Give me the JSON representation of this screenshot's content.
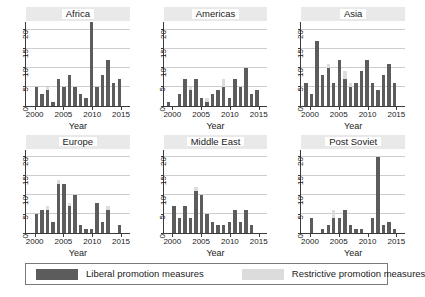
{
  "chart_data": {
    "type": "bar",
    "title": "",
    "subtitle": "",
    "xlabel": "Year",
    "ylabel": "",
    "ylim": [
      0,
      22
    ],
    "xlim": [
      1999,
      2016
    ],
    "grid": true,
    "stacked": true,
    "legend_position": "bottom",
    "yticks": [
      0,
      5,
      10,
      15,
      20
    ],
    "ytick_labels": [
      "0",
      "5",
      "10",
      "15",
      "20"
    ],
    "xticks": [
      2000,
      2005,
      2010,
      2015
    ],
    "xtick_labels": [
      "2000",
      "2005",
      "2010",
      "2015"
    ],
    "x": [
      1999,
      2000,
      2001,
      2002,
      2003,
      2004,
      2005,
      2006,
      2007,
      2008,
      2009,
      2010,
      2011,
      2012,
      2013,
      2014,
      2015,
      2016
    ],
    "series_names": [
      "Liberal promotion measures",
      "Restrictive promotion measures"
    ],
    "colors": {
      "liberal": "#5c5c5c",
      "restrictive": "#dcdcdc",
      "gridline": "#cdcdcd",
      "axis": "#3b3b3b",
      "strip_background": "#e9e9e9",
      "background": "#ffffff"
    },
    "panels": [
      {
        "title": "Africa",
        "series": [
          {
            "name": "Liberal promotion measures",
            "values": [
              0,
              5,
              3,
              4,
              1,
              7,
              5,
              8,
              5,
              3,
              2,
              22,
              5,
              8,
              12,
              6,
              7,
              0
            ]
          },
          {
            "name": "Restrictive promotion measures",
            "values": [
              0,
              0,
              0,
              1,
              0,
              0,
              0,
              0,
              0,
              0,
              0,
              0,
              0,
              0,
              0,
              0,
              0,
              0
            ]
          }
        ]
      },
      {
        "title": "Americas",
        "series": [
          {
            "name": "Liberal promotion measures",
            "values": [
              1,
              0,
              3,
              7,
              4,
              7,
              2,
              1,
              3,
              4,
              5,
              2,
              7,
              5,
              10,
              3,
              4,
              0
            ]
          },
          {
            "name": "Restrictive promotion measures",
            "values": [
              0,
              0,
              0,
              0,
              1,
              0,
              0,
              1,
              0,
              0,
              2,
              0,
              0,
              0,
              0,
              0,
              0,
              0
            ]
          }
        ]
      },
      {
        "title": "Asia",
        "series": [
          {
            "name": "Liberal promotion measures",
            "values": [
              6,
              3,
              17,
              8,
              10,
              6,
              12,
              7,
              5,
              6,
              9,
              12,
              6,
              4,
              8,
              11,
              6,
              0
            ]
          },
          {
            "name": "Restrictive promotion measures",
            "values": [
              0,
              0,
              0,
              0,
              1,
              0,
              0,
              2,
              1,
              0,
              0,
              0,
              0,
              0,
              0,
              0,
              0,
              0
            ]
          }
        ]
      },
      {
        "title": "Europe",
        "series": [
          {
            "name": "Liberal promotion measures",
            "values": [
              0,
              5,
              6,
              6,
              3,
              13,
              13,
              7,
              10,
              2,
              1,
              1,
              8,
              3,
              6,
              0,
              2,
              0
            ]
          },
          {
            "name": "Restrictive promotion measures",
            "values": [
              0,
              0,
              0,
              1,
              0,
              1,
              0,
              1,
              0,
              0,
              0,
              0,
              0,
              0,
              1,
              0,
              0,
              0
            ]
          }
        ]
      },
      {
        "title": "Middle East",
        "series": [
          {
            "name": "Liberal promotion measures",
            "values": [
              0,
              7,
              4,
              7,
              4,
              11,
              10,
              5,
              3,
              2,
              2,
              3,
              6,
              3,
              6,
              2,
              0,
              0
            ]
          },
          {
            "name": "Restrictive promotion measures",
            "values": [
              0,
              0,
              0,
              0,
              0,
              1,
              0,
              0,
              0,
              0,
              0,
              0,
              0,
              0,
              0,
              0,
              0,
              0
            ]
          }
        ]
      },
      {
        "title": "Post Soviet",
        "series": [
          {
            "name": "Liberal promotion measures",
            "values": [
              0,
              4,
              0,
              1,
              2,
              4,
              4,
              6,
              2,
              1,
              1,
              0,
              4,
              20,
              2,
              3,
              1,
              0
            ]
          },
          {
            "name": "Restrictive promotion measures",
            "values": [
              0,
              0,
              0,
              0,
              0,
              2,
              0,
              0,
              0,
              0,
              0,
              0,
              0,
              0,
              0,
              0,
              0,
              0
            ]
          }
        ]
      }
    ]
  },
  "legend": {
    "items": [
      {
        "label": "Liberal promotion measures",
        "color": "#5c5c5c"
      },
      {
        "label": "Restrictive promotion measures",
        "color": "#dcdcdc"
      }
    ]
  }
}
